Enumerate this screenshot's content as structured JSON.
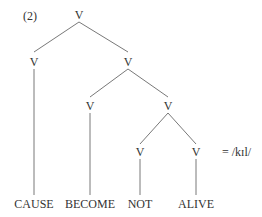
{
  "example_number": "(2)",
  "tree": {
    "root": "V",
    "left": "V",
    "right": "V",
    "right_left": "V",
    "right_right": "V",
    "rr_left": "V",
    "rr_right": "V"
  },
  "leaves": [
    "CAUSE",
    "BECOME",
    "NOT",
    "ALIVE"
  ],
  "gloss": "= /kɪl/"
}
